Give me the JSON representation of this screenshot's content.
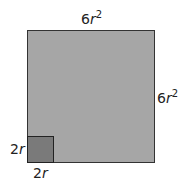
{
  "labels": {
    "top": {
      "coef": "6",
      "var": "r",
      "exp": "2"
    },
    "right": {
      "coef": "6",
      "var": "r",
      "exp": "2"
    },
    "small_left": {
      "coef": "2",
      "var": "r"
    },
    "small_bottom": {
      "coef": "2",
      "var": "r"
    }
  },
  "colors": {
    "large_fill": "#a6a6a6",
    "small_fill": "#7a7a7a",
    "stroke": "#333333"
  }
}
